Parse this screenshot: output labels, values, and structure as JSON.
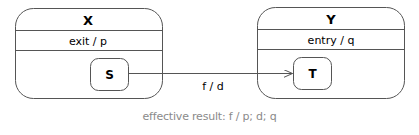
{
  "diagram": {
    "type": "uml-state-machine",
    "states": [
      {
        "id": "X",
        "name": "X",
        "action": "exit / p",
        "substate": "S"
      },
      {
        "id": "Y",
        "name": "Y",
        "action": "entry / q",
        "substate": "T"
      }
    ],
    "transition": {
      "from": "S",
      "to": "T",
      "label": "f / d"
    },
    "caption": "effective result: f / p; d; q",
    "colors": {
      "stroke": "#555555",
      "text": "#000000",
      "caption": "#8a8a8a"
    }
  }
}
